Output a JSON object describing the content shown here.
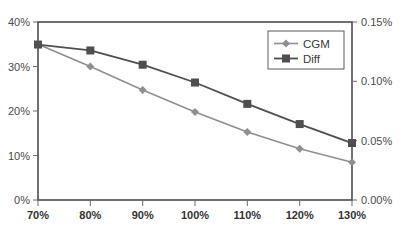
{
  "chart_data": {
    "type": "line",
    "title": "",
    "subtitle": "",
    "xlabel": "",
    "ylabel": "",
    "y2label": "",
    "grid": false,
    "legend_position": "top-right",
    "categories": [
      "70%",
      "80%",
      "90%",
      "100%",
      "110%",
      "120%",
      "130%"
    ],
    "x": [
      70,
      80,
      90,
      100,
      110,
      120,
      130
    ],
    "xlim": [
      70,
      130
    ],
    "ylim": [
      0,
      40
    ],
    "y2lim": [
      0,
      0.15
    ],
    "x_tick_labels": [
      "70%",
      "80%",
      "90%",
      "100%",
      "110%",
      "120%",
      "130%"
    ],
    "y_tick_labels": [
      "0%",
      "10%",
      "20%",
      "30%",
      "40%"
    ],
    "y_tick_values": [
      0,
      10,
      20,
      30,
      40
    ],
    "y2_tick_labels": [
      "0.00%",
      "0.05%",
      "0.10%",
      "0.15%"
    ],
    "y2_tick_values": [
      0,
      0.05,
      0.1,
      0.15
    ],
    "series": [
      {
        "name": "CGM",
        "axis": "left",
        "color": "#8f8f8f",
        "marker": "diamond",
        "values": [
          35.0,
          30.0,
          24.7,
          19.8,
          15.3,
          11.5,
          8.5
        ]
      },
      {
        "name": "Diff",
        "axis": "right",
        "color": "#4f4f4f",
        "marker": "square",
        "values": [
          0.131,
          0.126,
          0.114,
          0.099,
          0.081,
          0.064,
          0.048
        ]
      }
    ]
  },
  "legend": {
    "entries": [
      {
        "label": "CGM"
      },
      {
        "label": "Diff"
      }
    ]
  },
  "colors": {
    "series_cgm": "#8f8f8f",
    "series_diff": "#4f4f4f",
    "axis": "#4d4d4d",
    "background": "#ffffff"
  }
}
